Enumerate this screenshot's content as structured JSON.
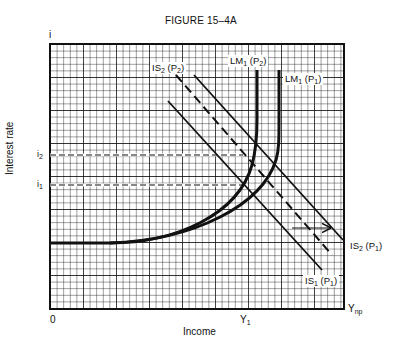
{
  "figure": {
    "title": "FIGURE 15–4A",
    "y_axis_symbol": "i",
    "y_axis_label": "Interest rate",
    "x_axis_label": "Income",
    "origin_label": "0",
    "x_ticks": [
      {
        "label": "Y",
        "sub": "1"
      },
      {
        "label": "Y",
        "sub": "np"
      }
    ],
    "y_ticks": [
      {
        "label": "i",
        "sub": "2"
      },
      {
        "label": "i",
        "sub": "1"
      }
    ],
    "curves": [
      {
        "label": "LM",
        "sub1": "1",
        "paren": "(P",
        "sub2": "2",
        "close": ")",
        "style": "solid-thick"
      },
      {
        "label": "LM",
        "sub1": "1",
        "paren": "(P",
        "sub2": "1",
        "close": ")",
        "style": "solid-thick"
      },
      {
        "label": "IS",
        "sub1": "2",
        "paren": "(P",
        "sub2": "2",
        "close": ")",
        "style": "dashed"
      },
      {
        "label": "IS",
        "sub1": "2",
        "paren": "(P",
        "sub2": "1",
        "close": ")",
        "style": "solid"
      },
      {
        "label": "IS",
        "sub1": "1",
        "paren": "(P",
        "sub2": "1",
        "close": ")",
        "style": "solid"
      }
    ],
    "annotations": [
      "arrow indicating rightward shift of IS curve"
    ]
  },
  "colors": {
    "ink": "#111111",
    "background": "#ffffff"
  }
}
